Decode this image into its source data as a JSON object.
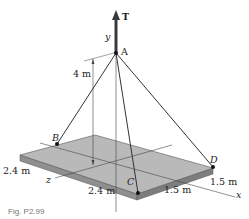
{
  "figure": {
    "force_label": "T",
    "axes": {
      "x": "x",
      "y": "y",
      "z": "z"
    },
    "points": {
      "A": "A",
      "B": "B",
      "C": "C",
      "D": "D"
    },
    "dimensions": {
      "height": "4 m",
      "left_depth": "2.4 m",
      "front_depth": "2.4 m",
      "front_width": "1.5 m",
      "right_width": "1.5 m"
    },
    "caption": "Fig. P2.99"
  },
  "colors": {
    "plate_top": "#b9b9b9",
    "plate_side": "#8f8f8f",
    "line": "#333333",
    "arrow": "#3a3a3a"
  }
}
